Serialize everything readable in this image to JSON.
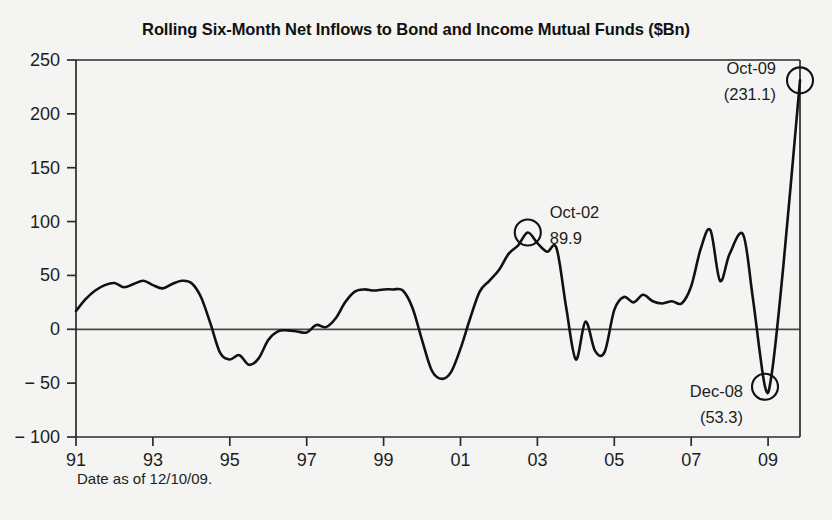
{
  "chart_data": {
    "type": "line",
    "title": "Rolling Six-Month Net Inflows to Bond and Income Mutual Funds ($Bn)",
    "xlabel": "",
    "ylabel": "",
    "footnote": "Date as of 12/10/09.",
    "grid": false,
    "legend": "none",
    "xlim": [
      1991,
      2009.83
    ],
    "ylim": [
      -100,
      250
    ],
    "ytick_labels": [
      "250",
      "200",
      "150",
      "100",
      "50",
      "0",
      "− 50",
      "− 100"
    ],
    "ytick_values": [
      250,
      200,
      150,
      100,
      50,
      0,
      -50,
      -100
    ],
    "xtick_labels": [
      "91",
      "93",
      "95",
      "97",
      "99",
      "01",
      "03",
      "05",
      "07",
      "09"
    ],
    "xtick_values": [
      1991,
      1993,
      1995,
      1997,
      1999,
      2001,
      2003,
      2005,
      2007,
      2009
    ],
    "series": [
      {
        "name": "Rolling Six-Month Net Inflows",
        "color": "#111111",
        "x": [
          1991.0,
          1991.25,
          1991.5,
          1991.75,
          1992.0,
          1992.25,
          1992.5,
          1992.75,
          1993.0,
          1993.25,
          1993.5,
          1993.75,
          1994.0,
          1994.25,
          1994.5,
          1994.75,
          1995.0,
          1995.25,
          1995.5,
          1995.75,
          1996.0,
          1996.25,
          1996.5,
          1996.75,
          1997.0,
          1997.25,
          1997.5,
          1997.75,
          1998.0,
          1998.25,
          1998.5,
          1998.75,
          1999.0,
          1999.25,
          1999.5,
          1999.75,
          2000.0,
          2000.25,
          2000.5,
          2000.75,
          2001.0,
          2001.25,
          2001.5,
          2001.75,
          2002.0,
          2002.25,
          2002.5,
          2002.75,
          2003.0,
          2003.25,
          2003.5,
          2003.75,
          2004.0,
          2004.25,
          2004.5,
          2004.75,
          2005.0,
          2005.25,
          2005.5,
          2005.75,
          2006.0,
          2006.25,
          2006.5,
          2006.75,
          2007.0,
          2007.25,
          2007.5,
          2007.75,
          2008.0,
          2008.35,
          2008.6,
          2008.92,
          2009.1,
          2009.4,
          2009.83
        ],
        "y": [
          17,
          28,
          36,
          41,
          43,
          39,
          42,
          45,
          41,
          38,
          42,
          45,
          43,
          30,
          5,
          -22,
          -28,
          -24,
          -33,
          -27,
          -10,
          -2,
          -1,
          -2,
          -3,
          4,
          2,
          10,
          25,
          35,
          37,
          36,
          37,
          37,
          36,
          20,
          -10,
          -38,
          -46,
          -40,
          -18,
          10,
          35,
          45,
          55,
          70,
          78,
          89.9,
          80,
          72,
          75,
          20,
          -28,
          7,
          -20,
          -21,
          18,
          30,
          25,
          32,
          26,
          24,
          26,
          24,
          40,
          75,
          92,
          45,
          70,
          88,
          30,
          -53.3,
          -40,
          60,
          231.1
        ]
      }
    ],
    "annotations": [
      {
        "id": "oct-02",
        "label_line1": "Oct-02",
        "label_line2": "89.9",
        "point_x": 2002.75,
        "point_y": 89.9,
        "marker": "circle"
      },
      {
        "id": "oct-09",
        "label_line1": "Oct-09",
        "label_line2": "(231.1)",
        "point_x": 2009.83,
        "point_y": 231.1,
        "marker": "circle"
      },
      {
        "id": "dec-08",
        "label_line1": "Dec-08",
        "label_line2": "(53.3)",
        "point_x": 2008.92,
        "point_y": -53.3,
        "marker": "circle"
      }
    ]
  }
}
